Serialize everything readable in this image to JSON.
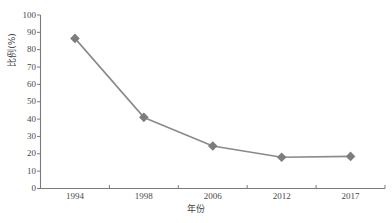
{
  "chart_data": {
    "type": "line",
    "title": "",
    "subtitle": "",
    "xlabel": "年份",
    "ylabel": "比例(%)",
    "categories": [
      "1994",
      "1998",
      "2006",
      "2012",
      "2017"
    ],
    "values": [
      86.5,
      41.0,
      24.5,
      18.0,
      18.5
    ],
    "series": [
      {
        "name": "比例(%)",
        "values": [
          86.5,
          41.0,
          24.5,
          18.0,
          18.5
        ]
      }
    ],
    "ylim": [
      0,
      100
    ],
    "ytick_step": 10,
    "yticks": [
      "100",
      "90",
      "80",
      "70",
      "60",
      "50",
      "40",
      "30",
      "20",
      "10",
      "0"
    ],
    "xticks": [
      "1994",
      "1998",
      "2006",
      "2012",
      "2017"
    ],
    "grid": false,
    "legend": false,
    "legend_position": "none",
    "marker": "diamond",
    "colors": {
      "line": "#8a8a8a",
      "marker": "#7d7d7d",
      "axis": "#7a7a7a",
      "text": "#4a4a4a",
      "background": "#ffffff"
    }
  },
  "axes": {
    "y_title": "比例(%)",
    "x_title": "年份"
  }
}
